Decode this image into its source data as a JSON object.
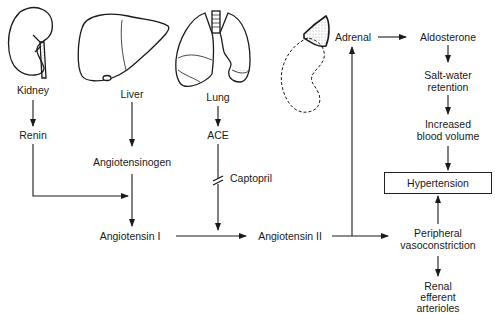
{
  "organs": {
    "kidney": "Kidney",
    "liver": "Liver",
    "lung": "Lung",
    "adrenal": "Adrenal"
  },
  "nodes": {
    "renin": "Renin",
    "angiotensinogen": "Angiotensinogen",
    "ace": "ACE",
    "captopril": "Captopril",
    "angiotensin_i": "Angiotensin I",
    "angiotensin_ii": "Angiotensin II",
    "aldosterone": "Aldosterone",
    "salt_water_1": "Salt-water",
    "salt_water_2": "retention",
    "blood_volume_1": "Increased",
    "blood_volume_2": "blood volume",
    "hypertension": "Hypertension",
    "vaso_1": "Peripheral",
    "vaso_2": "vasoconstriction",
    "renal_1": "Renal",
    "renal_2": "efferent",
    "renal_3": "arterioles"
  },
  "edges": [
    {
      "from": "Kidney",
      "to": "Renin"
    },
    {
      "from": "Renin",
      "to": "Angiotensin I"
    },
    {
      "from": "Liver",
      "to": "Angiotensinogen"
    },
    {
      "from": "Angiotensinogen",
      "to": "Angiotensin I"
    },
    {
      "from": "Lung",
      "to": "ACE"
    },
    {
      "from": "ACE",
      "to": "Angiotensin I",
      "blocked_by": "Captopril"
    },
    {
      "from": "Angiotensin I",
      "to": "Angiotensin II"
    },
    {
      "from": "Angiotensin II",
      "to": "Adrenal"
    },
    {
      "from": "Angiotensin II",
      "to": "Peripheral vasoconstriction"
    },
    {
      "from": "Adrenal",
      "to": "Aldosterone"
    },
    {
      "from": "Aldosterone",
      "to": "Salt-water retention"
    },
    {
      "from": "Salt-water retention",
      "to": "Increased blood volume"
    },
    {
      "from": "Increased blood volume",
      "to": "Hypertension"
    },
    {
      "from": "Peripheral vasoconstriction",
      "to": "Hypertension"
    },
    {
      "from": "Peripheral vasoconstriction",
      "to": "Renal efferent arterioles"
    }
  ]
}
